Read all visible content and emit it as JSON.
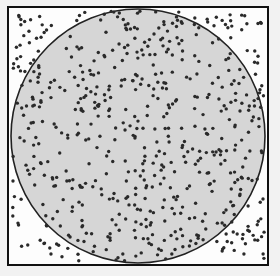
{
  "figure": {
    "canvas": {
      "width": 280,
      "height": 276
    },
    "background_color": "#f2f2f2",
    "square": {
      "label": "sampling-square",
      "x": 9,
      "y": 8,
      "width": 258,
      "height": 256,
      "fill_color": "#fdfdfd",
      "stroke_color": "#111111",
      "stroke_width": 2
    },
    "circle": {
      "label": "inscribed-circle",
      "center_x": 138,
      "center_y": 136,
      "radius": 127,
      "fill_color": "#d6d6d6",
      "stroke_color": "#222222",
      "stroke_width": 1.6
    },
    "points": {
      "label": "random-sample-points",
      "color": "#2a2a2a",
      "radius": 1.7,
      "count": 600,
      "seed": 20240517,
      "distribution": "uniform"
    }
  }
}
